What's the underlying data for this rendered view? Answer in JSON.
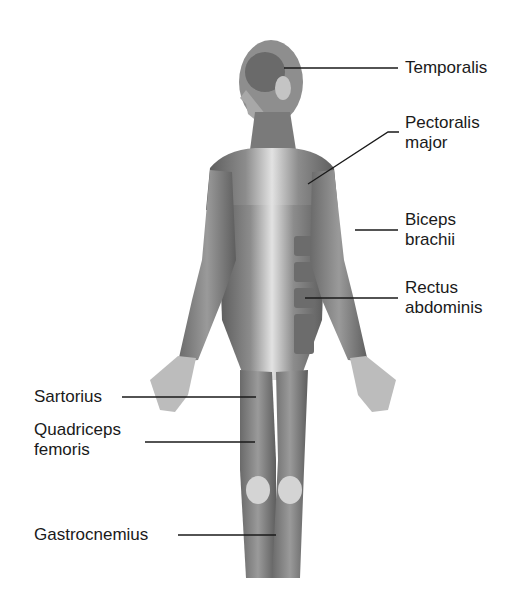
{
  "diagram": {
    "type": "anatomical-labeled-illustration",
    "colors": {
      "background": "#ffffff",
      "text": "#1a1a1a",
      "leader_line": "#1a1a1a",
      "muscle_dark": "#5a5a5a",
      "muscle_mid": "#8a8a8a",
      "muscle_light": "#d6d6d6"
    },
    "labels": [
      {
        "id": "temporalis",
        "text": "Temporalis",
        "side": "right"
      },
      {
        "id": "pectoralis-major",
        "text": "Pectoralis\nmajor",
        "side": "right"
      },
      {
        "id": "biceps-brachii",
        "text": "Biceps\nbrachii",
        "side": "right"
      },
      {
        "id": "rectus-abdominis",
        "text": "Rectus\nabdominis",
        "side": "right"
      },
      {
        "id": "sartorius",
        "text": "Sartorius",
        "side": "left"
      },
      {
        "id": "quadriceps-femoris",
        "text": "Quadriceps\nfemoris",
        "side": "left"
      },
      {
        "id": "gastrocnemius",
        "text": "Gastrocnemius",
        "side": "left"
      }
    ]
  }
}
